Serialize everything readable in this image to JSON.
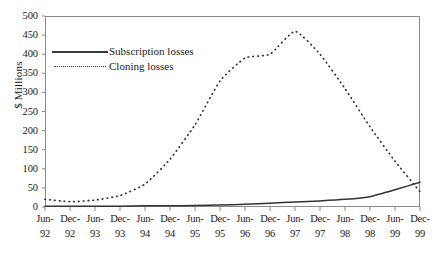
{
  "chart_data": {
    "type": "line",
    "title": "",
    "xlabel": "",
    "ylabel": "$ Millions",
    "ylim": [
      0,
      500
    ],
    "ytick_step": 50,
    "grid": false,
    "legend_position": "top-left",
    "y_ticks": [
      "0",
      "50",
      "100",
      "150",
      "200",
      "250",
      "300",
      "350",
      "400",
      "450",
      "500"
    ],
    "categories": [
      "Jun-92",
      "Dec-92",
      "Jun-93",
      "Dec-93",
      "Jun-94",
      "Dec-94",
      "Jun-95",
      "Dec-95",
      "Jun-96",
      "Dec-96",
      "Jun-97",
      "Dec-97",
      "Jun-98",
      "Dec-98",
      "Jun-99",
      "Dec-99"
    ],
    "x_tick_labels": [
      {
        "month": "Jun-",
        "year": "92"
      },
      {
        "month": "Dec-",
        "year": "92"
      },
      {
        "month": "Jun-",
        "year": "93"
      },
      {
        "month": "Dec-",
        "year": "93"
      },
      {
        "month": "Jun-",
        "year": "94"
      },
      {
        "month": "Dec-",
        "year": "94"
      },
      {
        "month": "Jun-",
        "year": "95"
      },
      {
        "month": "Dec-",
        "year": "95"
      },
      {
        "month": "Jun-",
        "year": "96"
      },
      {
        "month": "Dec-",
        "year": "96"
      },
      {
        "month": "Jun-",
        "year": "97"
      },
      {
        "month": "Dec-",
        "year": "97"
      },
      {
        "month": "Jun-",
        "year": "98"
      },
      {
        "month": "Dec-",
        "year": "98"
      },
      {
        "month": "Jun-",
        "year": "99"
      },
      {
        "month": "Dec-",
        "year": "99"
      }
    ],
    "series": [
      {
        "name": "Subscription losses",
        "style": "solid",
        "color": "#333333",
        "values": [
          2,
          2,
          2,
          2,
          3,
          3,
          4,
          5,
          7,
          10,
          13,
          16,
          20,
          27,
          45,
          65
        ]
      },
      {
        "name": "Cloning losses",
        "style": "dotted",
        "color": "#333333",
        "values": [
          20,
          14,
          18,
          30,
          60,
          125,
          215,
          330,
          390,
          400,
          460,
          400,
          310,
          210,
          120,
          40
        ]
      }
    ]
  },
  "legend": {
    "items": [
      {
        "label": "Subscription losses",
        "style": "solid"
      },
      {
        "label": "Cloning losses",
        "style": "dotted"
      }
    ]
  }
}
